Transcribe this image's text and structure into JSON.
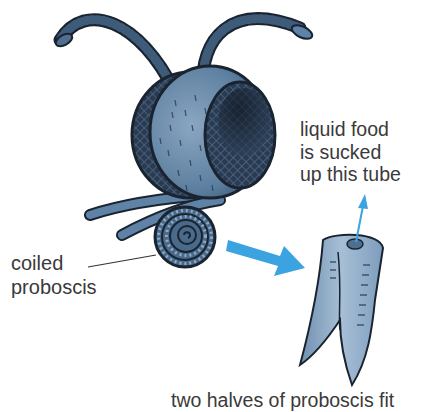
{
  "diagram": {
    "labels": {
      "coiled_proboscis": [
        "coiled",
        "proboscis"
      ],
      "liquid_food": [
        "liquid food",
        "is sucked",
        "up this tube"
      ],
      "two_halves": "two halves of proboscis fit"
    },
    "colors": {
      "body_blue": "#5d7f9f",
      "dark_outline": "#1a2430",
      "eye_dark": "#1c2838",
      "arrow_blue": "#3ba3e0",
      "tube_blue": "#7f9fbd",
      "label_text": "#3a3a3a"
    }
  }
}
